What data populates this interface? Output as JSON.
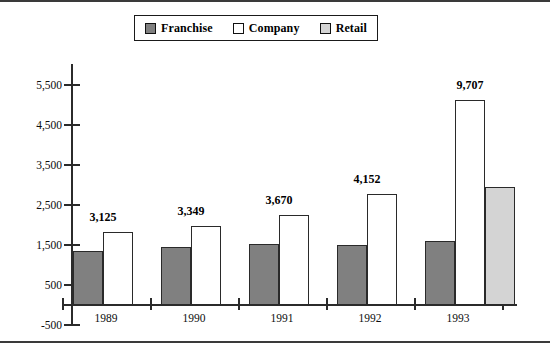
{
  "legend": {
    "entries": [
      {
        "label": "Franchise",
        "color": "#808080",
        "icon": "legend-swatch-icon"
      },
      {
        "label": "Company",
        "color": "#ffffff",
        "icon": "legend-swatch-icon"
      },
      {
        "label": "Retail",
        "color": "#d4d4d4",
        "icon": "legend-swatch-icon"
      }
    ]
  },
  "chart_data": {
    "type": "bar",
    "title": "",
    "subtitle": "",
    "xlabel": "",
    "ylabel": "",
    "grid": false,
    "legend_position": "top-center",
    "categories": [
      "1989",
      "1990",
      "1991",
      "1992",
      "1993"
    ],
    "ylim": [
      -500,
      5500
    ],
    "yticks": [
      -500,
      500,
      1500,
      2500,
      3500,
      4500,
      5500
    ],
    "ytick_labels": [
      "-500",
      "500",
      "1,500",
      "2,500",
      "3,500",
      "4,500",
      "5,500"
    ],
    "series": [
      {
        "name": "Franchise",
        "color": "#808080",
        "values": [
          1360,
          1440,
          1525,
          1490,
          1600
        ]
      },
      {
        "name": "Company",
        "color": "#ffffff",
        "values": [
          1825,
          1975,
          2245,
          2780,
          5125
        ]
      },
      {
        "name": "Retail",
        "color": "#d4d4d4",
        "values": [
          null,
          null,
          null,
          null,
          2950
        ]
      }
    ],
    "annotations": [
      {
        "category": "1989",
        "text": "3,125"
      },
      {
        "category": "1990",
        "text": "3,349"
      },
      {
        "category": "1991",
        "text": "3,670"
      },
      {
        "category": "1992",
        "text": "4,152"
      },
      {
        "category": "1993",
        "text": "9,707"
      }
    ]
  }
}
